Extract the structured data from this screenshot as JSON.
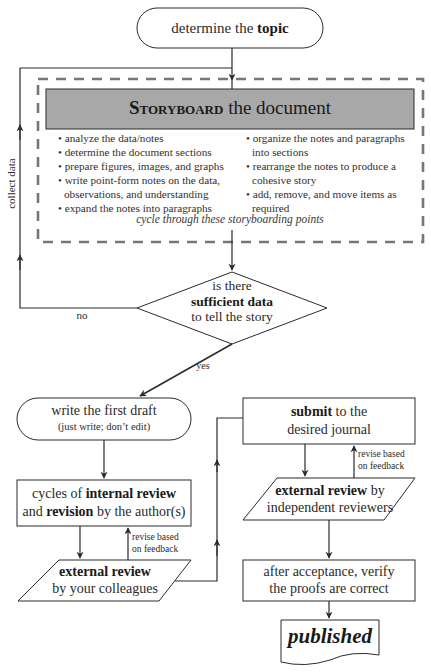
{
  "diagram": {
    "colors": {
      "line": "#2b2b2b",
      "dashed_border": "#777777",
      "header_fill": "#a8a8a8",
      "text": "#2a2a2a"
    },
    "nodes": {
      "topic": {
        "pre": "determine the ",
        "bold": "topic"
      },
      "storyboard": {
        "title_bold": "Storyboard",
        "title_rest": " the document",
        "left_items": [
          "• analyze the data/notes",
          "• determine the document sections",
          "• prepare figures, images, and graphs",
          "• write point-form notes on the data,",
          "observations, and understanding",
          "• expand the notes into paragraphs"
        ],
        "right_items": [
          "• organize the notes and paragraphs",
          "into sections",
          "• rearrange the notes to produce a",
          "cohesive story",
          "• add, remove, and move items as",
          "required"
        ],
        "cycle_note": "cycle through these storyboarding points"
      },
      "decision": {
        "line1": "is there",
        "line2_bold": "sufficient data",
        "line3": "to tell the story"
      },
      "first_draft": {
        "line1": "write the first draft",
        "line2": "(just write; don’t edit)"
      },
      "internal_review": {
        "line1_pre": "cycles of ",
        "line1_bold": "internal review",
        "line2_bold": "revision",
        "line2_pre": "and ",
        "line2_post": " by the author(s)"
      },
      "external_colleagues": {
        "line1_bold": "external review",
        "line2": "by your colleagues"
      },
      "submit": {
        "line1_bold": "submit",
        "line1_post": " to the",
        "line2": "desired journal"
      },
      "external_independent": {
        "line1_bold": "external review",
        "line1_post": " by",
        "line2": "independent reviewers"
      },
      "proofs": {
        "line1": "after acceptance, verify",
        "line2": "the proofs are correct"
      },
      "published": {
        "label": "published"
      }
    },
    "edge_labels": {
      "collect_data": "collect data",
      "no": "no",
      "yes": "yes",
      "revise_left_1": "revise based",
      "revise_left_2": "on feedback",
      "revise_right_1": "revise based",
      "revise_right_2": "on feedback"
    }
  }
}
